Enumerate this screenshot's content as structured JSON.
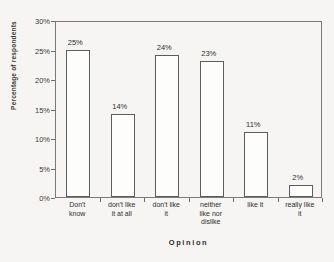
{
  "chart_data": {
    "type": "bar",
    "title": "",
    "xlabel": "Opinion",
    "ylabel": "Percentage of respondents",
    "categories": [
      "Don't know",
      "don't like it at all",
      "don't like it",
      "neither like nor dislike",
      "like it",
      "really like it"
    ],
    "category_lines": [
      [
        "Don't",
        "know"
      ],
      [
        "don't like",
        "it at all"
      ],
      [
        "don't like",
        "it"
      ],
      [
        "neither",
        "like nor",
        "dislike"
      ],
      [
        "like it"
      ],
      [
        "really like",
        "it"
      ]
    ],
    "values": [
      25,
      14,
      24,
      23,
      11,
      2
    ],
    "data_labels": [
      "25%",
      "14%",
      "24%",
      "23%",
      "11%",
      "2%"
    ],
    "ylim": [
      0,
      30
    ],
    "ytick_values": [
      30,
      25,
      20,
      15,
      10,
      5,
      0
    ],
    "ytick_labels": [
      "30%",
      "25%",
      "20%",
      "15%",
      "10%",
      "5%",
      "0%"
    ],
    "grid": false,
    "legend": false,
    "bar_fill": "#fdfdfc",
    "bar_edge": "#5d5d5d",
    "axis_color": "#7a7a7a",
    "background": "#f6f5f3"
  }
}
